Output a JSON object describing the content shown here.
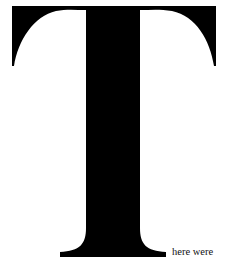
{
  "document": {
    "drop_cap": {
      "letter": "T",
      "color": "#000000"
    },
    "trailing_text": "here were"
  }
}
